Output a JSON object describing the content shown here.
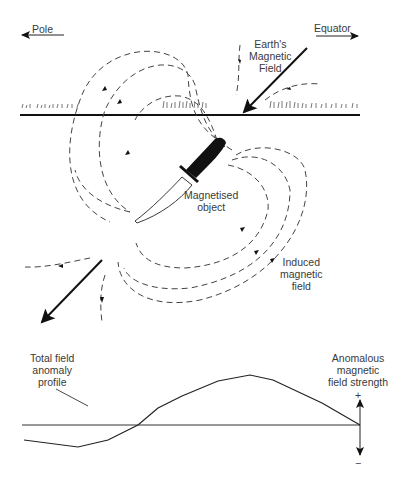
{
  "labels": {
    "pole": "Pole",
    "equator": "Equator",
    "earth_field": [
      "Earth's",
      "Magnetic",
      "Field"
    ],
    "object": [
      "Magnetised",
      "object"
    ],
    "induced": [
      "Induced",
      "magnetic",
      "field"
    ],
    "profile": [
      "Total field",
      "anomaly",
      "profile"
    ],
    "anomalous": [
      "Anomalous",
      "magnetic",
      "field strength"
    ],
    "plus": "+",
    "minus": "−"
  },
  "colors": {
    "line": "#222222",
    "text": "#3a3a3a",
    "background": "#ffffff"
  }
}
